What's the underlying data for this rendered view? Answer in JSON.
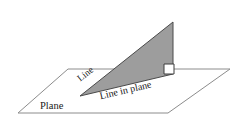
{
  "figure": {
    "background_color": "#ffffff",
    "labels": {
      "plane": "Plane",
      "line": "Line",
      "line_in_plane": "Line in plane"
    },
    "colors": {
      "triangle_fill": "#9d9d9d",
      "triangle_stroke": "#4a4a4a",
      "plane_stroke": "#8c8c8c",
      "text": "#1a1a1a",
      "right_angle_stroke": "#3c3c3c"
    },
    "geometry": {
      "plane_polygon": "18,113 68,69 230,69 168,113",
      "triangle_polygon": "80,96 173,22 173,74",
      "right_angle_marker": "164,64 174,64 174,74 164,74",
      "base_segment": {
        "x1": 80,
        "y1": 96,
        "x2": 173,
        "y2": 74
      }
    },
    "label_positions": {
      "plane": {
        "x": 40,
        "y": 107,
        "rotation": 0
      },
      "line": {
        "x": 79,
        "y": 80,
        "rotation": -38
      },
      "line_in_plane": {
        "x": 100,
        "y": 97,
        "rotation": -13
      }
    }
  }
}
